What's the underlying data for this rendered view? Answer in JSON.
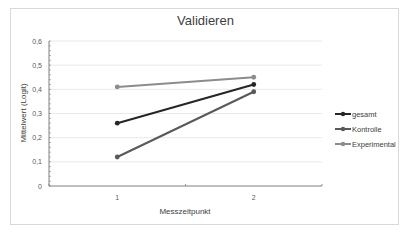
{
  "chart_data": {
    "type": "line",
    "title": "Validieren",
    "xlabel": "Messzeitpunkt",
    "ylabel": "Mittelwert (Logit)",
    "categories": [
      "1",
      "2"
    ],
    "yticks": [
      "0",
      "0,1",
      "0,2",
      "0,3",
      "0,4",
      "0,5",
      "0,6"
    ],
    "ylim": [
      0,
      0.6
    ],
    "grid": true,
    "legend_position": "right",
    "series": [
      {
        "name": "gesamt",
        "values": [
          0.26,
          0.42
        ],
        "color": "#262626"
      },
      {
        "name": "Kontrolle",
        "values": [
          0.12,
          0.39
        ],
        "color": "#595959"
      },
      {
        "name": "Experimental",
        "values": [
          0.41,
          0.45
        ],
        "color": "#8c8c8c"
      }
    ]
  }
}
